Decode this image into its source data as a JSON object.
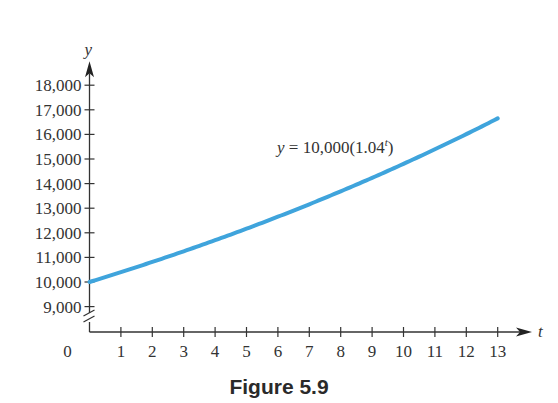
{
  "chart_data": {
    "type": "line",
    "title": "",
    "caption": "Figure 5.9",
    "xlabel": "t",
    "ylabel": "y",
    "xlim": [
      0,
      13
    ],
    "ylim": [
      9000,
      18000
    ],
    "x_ticks": [
      1,
      2,
      3,
      4,
      5,
      6,
      7,
      8,
      9,
      10,
      11,
      12,
      13
    ],
    "x_tick_labels": [
      "1",
      "2",
      "3",
      "4",
      "5",
      "6",
      "7",
      "8",
      "9",
      "10",
      "11",
      "12",
      "13"
    ],
    "origin_label": "0",
    "y_ticks": [
      9000,
      10000,
      11000,
      12000,
      13000,
      14000,
      15000,
      16000,
      17000,
      18000
    ],
    "y_tick_labels": [
      "9,000",
      "10,000",
      "11,000",
      "12,000",
      "13,000",
      "14,000",
      "15,000",
      "16,000",
      "17,000",
      "18,000"
    ],
    "y_axis_break": true,
    "grid": false,
    "series": [
      {
        "name": "y = 10,000(1.04^t)",
        "color": "#3fa4dc",
        "formula": {
          "a": 10000,
          "b": 1.04
        },
        "x": [
          0,
          1,
          2,
          3,
          4,
          5,
          6,
          7,
          8,
          9,
          10,
          11,
          12,
          13
        ],
        "values": [
          10000,
          10400,
          10816,
          11249,
          11699,
          12167,
          12653,
          13159,
          13686,
          14233,
          14802,
          15395,
          16010,
          16651
        ]
      }
    ],
    "annotation": {
      "prefix": "y = 10,000(1.04",
      "superscript": "t",
      "suffix": ")"
    }
  }
}
